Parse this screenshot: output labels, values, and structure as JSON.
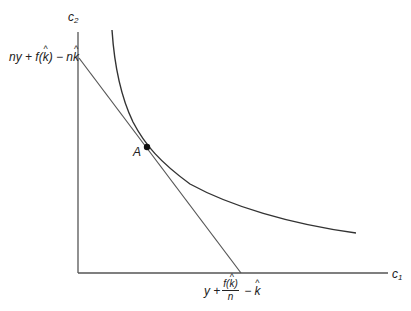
{
  "diagram": {
    "axes": {
      "y_label_base": "c",
      "y_label_sub": "2",
      "x_label_base": "c",
      "x_label_sub": "1",
      "origin": [
        78,
        273
      ],
      "y_top": 32,
      "x_right": 388
    },
    "y_intercept_label": {
      "part1": "ny + f(",
      "k": "k",
      "part2": ") − n",
      "k2": "k"
    },
    "x_intercept_label": {
      "prefix": "y + ",
      "numerator_pre": "f(",
      "numerator_k": "k",
      "numerator_post": ")",
      "denominator": "n",
      "suffix": " − ",
      "k": "k"
    },
    "point": {
      "label": "A",
      "x": 147,
      "y": 147
    },
    "budget_line": {
      "from": [
        79,
        58
      ],
      "to": [
        241,
        273
      ]
    },
    "indifference_curve": {
      "points": [
        [
          112,
          30
        ],
        [
          118,
          70
        ],
        [
          125,
          100
        ],
        [
          135,
          125
        ],
        [
          147,
          147
        ],
        [
          160,
          162
        ],
        [
          180,
          178
        ],
        [
          200,
          190
        ],
        [
          240,
          208
        ],
        [
          280,
          220
        ],
        [
          320,
          228
        ],
        [
          356,
          233
        ]
      ]
    },
    "colors": {
      "axis": "#555555",
      "line": "#555555",
      "curve": "#333333",
      "point": "#111111"
    }
  }
}
